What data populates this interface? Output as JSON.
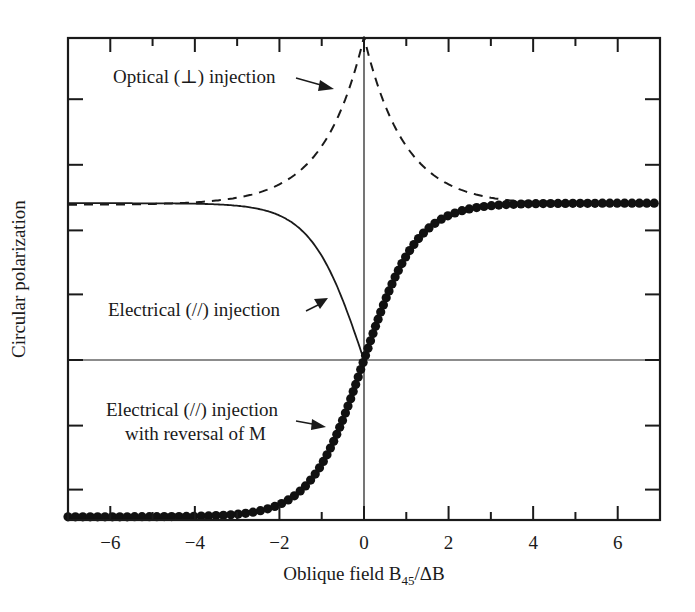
{
  "chart_data": {
    "type": "line",
    "title": "",
    "xlabel": "Oblique field B45/ΔB",
    "xlabel_parts": {
      "main": "Oblique field B",
      "sub": "45",
      "tail": "/ΔB"
    },
    "ylabel": "Circular polarization",
    "xlim": [
      -7,
      7
    ],
    "ylim": [
      -1,
      2.05
    ],
    "x_ticks_major": [
      -6,
      -4,
      -2,
      0,
      2,
      4,
      6
    ],
    "x_tick_labels": [
      "−6",
      "−4",
      "−2",
      "0",
      "2",
      "4",
      "6"
    ],
    "x_ticks_minor": [
      -5,
      -3,
      -1,
      1,
      3,
      5
    ],
    "y_ticks": [
      -0.81,
      -0.41,
      0,
      0.41,
      0.81,
      1.22,
      1.63
    ],
    "y_tick_labels": [],
    "grid": false,
    "reference_lines": {
      "x_zero": true,
      "y_zero": true
    },
    "series": [
      {
        "name": "Optical (⊥) injection",
        "style": "dashed",
        "description": "Symmetric cusp peaking at x=0 (top of frame), decaying to ~0.98 at |x|=7",
        "x": [
          -7,
          -6,
          -5,
          -4,
          -3,
          -2,
          -1.5,
          -1,
          -0.5,
          0,
          0.5,
          1,
          1.5,
          2,
          3,
          4,
          5,
          6,
          7
        ],
        "y": [
          0.98,
          1.0,
          1.02,
          1.06,
          1.12,
          1.25,
          1.37,
          1.55,
          1.78,
          2.02,
          1.78,
          1.55,
          1.37,
          1.25,
          1.12,
          1.06,
          1.02,
          1.0,
          0.98
        ]
      },
      {
        "name": "Electrical (//) injection",
        "style": "solid",
        "description": "Flat ~0.98 for negative x, drops to 0 at x=0 (defined for x<=0)",
        "x": [
          -7,
          -6,
          -5,
          -4,
          -3,
          -2,
          -1.5,
          -1,
          -0.5,
          0
        ],
        "y": [
          0.98,
          0.97,
          0.96,
          0.94,
          0.89,
          0.76,
          0.63,
          0.45,
          0.23,
          0.0
        ]
      },
      {
        "name": "Electrical (//) injection with reversal of M",
        "style": "dots",
        "description": "Odd tanh-like curve from -0.98 at x=-7 to +0.98 at x=7",
        "x": [
          -7,
          -6,
          -5,
          -4,
          -3,
          -2,
          -1.5,
          -1,
          -0.5,
          0,
          0.5,
          1,
          1.5,
          2,
          3,
          4,
          5,
          6,
          7
        ],
        "y": [
          -0.98,
          -0.97,
          -0.96,
          -0.94,
          -0.89,
          -0.76,
          -0.63,
          -0.45,
          -0.23,
          0.0,
          0.23,
          0.45,
          0.63,
          0.76,
          0.89,
          0.94,
          0.96,
          0.97,
          0.98
        ]
      }
    ],
    "annotations": [
      {
        "text": "Optical (⊥) injection",
        "points_to": "Optical (⊥) injection",
        "at_x": -0.4
      },
      {
        "text": "Electrical (//) injection",
        "points_to": "Electrical (//) injection",
        "at_x": -0.9
      },
      {
        "text": "Electrical (//) injection",
        "text2": "with reversal of M",
        "points_to": "Electrical (//) injection with reversal of M",
        "at_x": -1.1
      }
    ],
    "legend": "none (inline annotations with arrows)"
  }
}
